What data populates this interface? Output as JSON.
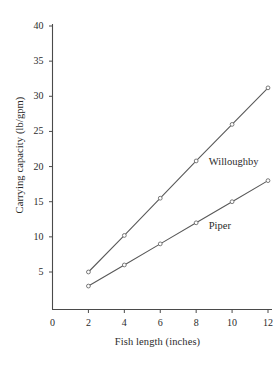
{
  "chart_data": {
    "type": "line",
    "title": "",
    "subtitle": "",
    "xlabel": "Fish length (inches)",
    "ylabel": "Carrying capacity (lb/gpm)",
    "x": [
      2,
      4,
      6,
      8,
      10,
      12
    ],
    "xlim": [
      0,
      12.6
    ],
    "ylim": [
      0,
      41.5
    ],
    "xticks": [
      0,
      2,
      4,
      6,
      8,
      10,
      12
    ],
    "xtick_labels": [
      "0",
      "2",
      "4",
      "6",
      "8",
      "10",
      "12"
    ],
    "yticks": [
      5,
      10,
      15,
      20,
      25,
      30,
      35,
      40
    ],
    "ytick_labels": [
      "5",
      "10",
      "15",
      "20",
      "25",
      "30",
      "35",
      "40"
    ],
    "grid": false,
    "legend_position": "inline-annotation",
    "series": [
      {
        "name": "Willoughby",
        "values": [
          5.0,
          10.2,
          15.5,
          20.8,
          26.0,
          31.2
        ],
        "color": "#595959",
        "marker": "open-circle",
        "label_x": 8.7,
        "label_y": 20.6
      },
      {
        "name": "Piper",
        "values": [
          3.0,
          6.0,
          9.0,
          12.0,
          15.0,
          18.0
        ],
        "color": "#595959",
        "marker": "open-circle",
        "label_x": 8.7,
        "label_y": 11.5
      }
    ],
    "annotations": [
      {
        "text": "Willoughby",
        "x": 8.7,
        "y": 20.6
      },
      {
        "text": "Piper",
        "x": 8.7,
        "y": 11.5
      }
    ]
  },
  "axes": {
    "y_title": "Carrying capacity (lb/gpm)",
    "x_title": "Fish length (inches)"
  }
}
